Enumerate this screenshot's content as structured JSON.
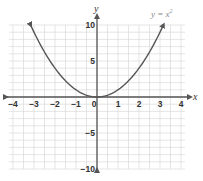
{
  "chart_data": {
    "type": "line",
    "title": "",
    "function_label": "y = x²",
    "function_label_base": "y = x",
    "function_label_exp": "2",
    "xlabel": "x",
    "ylabel": "y",
    "xlim": [
      -4,
      4
    ],
    "ylim": [
      -10,
      10
    ],
    "x_ticks": [
      -4,
      -3,
      -2,
      -1,
      0,
      1,
      2,
      3,
      4
    ],
    "x_tick_labels": [
      "−4",
      "−3",
      "−2",
      "−1",
      "0",
      "1",
      "2",
      "3",
      "4"
    ],
    "y_ticks": [
      10,
      5,
      -5,
      -10
    ],
    "y_tick_labels": [
      "10",
      "5",
      "−5",
      "−10"
    ],
    "grid": true,
    "grid_x_step": 1,
    "grid_y_step": 1,
    "series": [
      {
        "name": "y = x^2",
        "x": [
          -3.16,
          -3,
          -2.5,
          -2,
          -1.5,
          -1,
          -0.5,
          0,
          0.5,
          1,
          1.5,
          2,
          2.5,
          3,
          3.16
        ],
        "y": [
          10,
          9,
          6.25,
          4,
          2.25,
          1,
          0.25,
          0,
          0.25,
          1,
          2.25,
          4,
          6.25,
          9,
          10
        ],
        "arrows_on_ends": true
      }
    ],
    "colors": {
      "grid": "#d4d4d4",
      "axis": "#555555",
      "curve": "#555555",
      "text": "#333333",
      "label": "#888888"
    }
  }
}
